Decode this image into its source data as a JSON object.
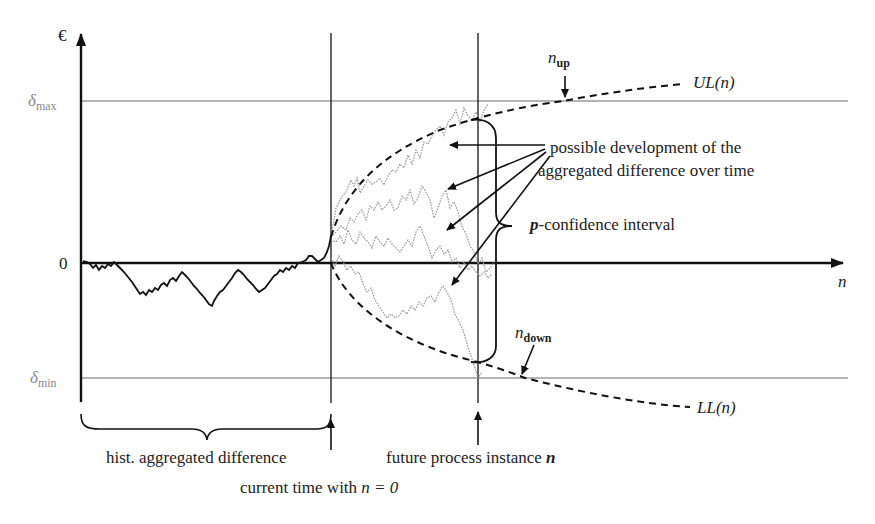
{
  "figure": {
    "y_axis_label": "€",
    "x_axis_label": "n",
    "zero_label": "0",
    "delta_max_label": "δ",
    "delta_max_sub": "max",
    "delta_min_label": "δ",
    "delta_min_sub": "min",
    "upper_limit_label": "UL(n)",
    "lower_limit_label": "LL(n)",
    "n_up_label": "n",
    "n_up_sub": "up",
    "n_down_label": "n",
    "n_down_sub": "down",
    "possible_dev_line1": "possible development of the",
    "possible_dev_line2": "aggregated difference over time",
    "confidence_prefix": "p",
    "confidence_suffix": "-confidence interval",
    "hist_label": "hist. aggregated difference",
    "current_time_label": "current time with ",
    "current_time_math": "n = 0",
    "future_label": "future process instance ",
    "future_math": "n"
  },
  "colors": {
    "axis": "#111111",
    "reference_line": "#9a9a9a",
    "reference_label": "#888888",
    "history_path": "#111111",
    "simulated_paths": "#999999",
    "limit_curve": "#111111"
  }
}
